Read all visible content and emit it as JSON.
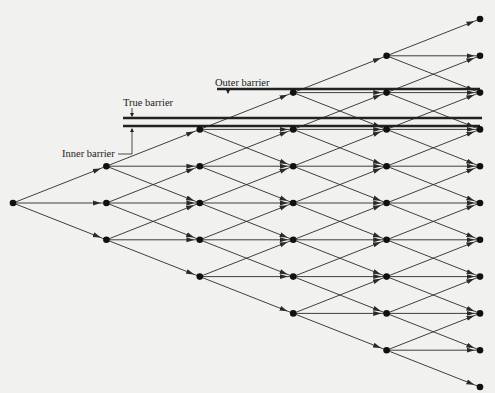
{
  "diagram": {
    "type": "trinomial-tree",
    "steps": 5,
    "colors": {
      "line": "#2a2a2a",
      "node": "#111111",
      "barrier": "#222222",
      "background": "#f1f1ef"
    },
    "root": {
      "x": 13,
      "y": 203
    },
    "dx": 93.4,
    "dy": 36.8,
    "barriers": [
      {
        "name": "outer",
        "label": "Outer barrier",
        "y": 89,
        "x1": 217,
        "x2": 480
      },
      {
        "name": "true",
        "label": "True barrier",
        "y": 118,
        "x1": 123,
        "x2": 482
      },
      {
        "name": "inner",
        "label": "Inner barrier",
        "y": 126,
        "x1": 123,
        "x2": 480
      }
    ],
    "labels": {
      "outer": {
        "text": "Outer barrier",
        "x": 215,
        "y": 86,
        "arrow_x": 228,
        "arrow_y1": 88,
        "arrow_y2": 93
      },
      "true": {
        "text": "True barrier",
        "x": 123,
        "y": 106,
        "arrow_x": 132,
        "arrow_y1": 108,
        "arrow_y2": 116
      },
      "inner": {
        "text": "Inner barrier",
        "x": 62,
        "y": 157,
        "arrow_x": 132,
        "arrow_y1": 129,
        "arrow_y2": 154,
        "hook_x": 118
      }
    }
  }
}
